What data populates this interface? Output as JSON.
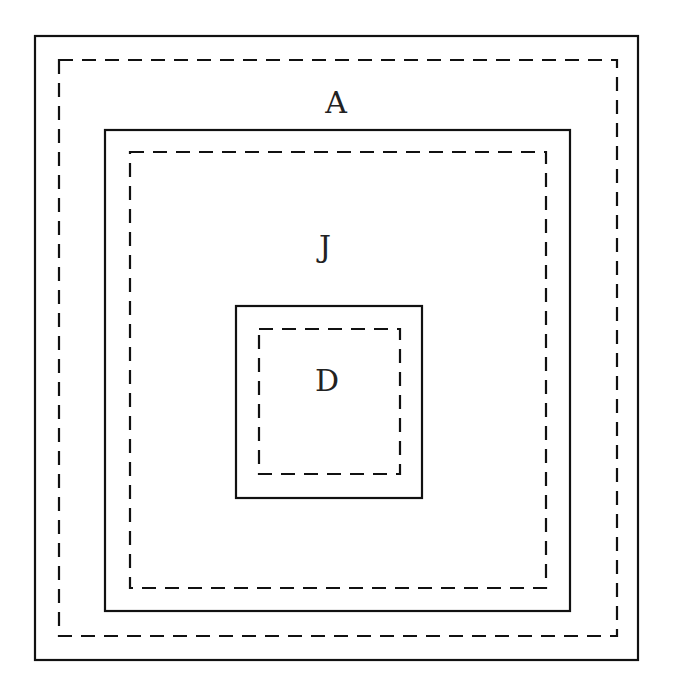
{
  "diagram": {
    "type": "nested-regions",
    "regions": [
      {
        "label": "A",
        "solid": {
          "x1": 35,
          "y1": 36,
          "x2": 638,
          "y2": 660
        },
        "dashed": {
          "x1": 59,
          "y1": 60,
          "x2": 617,
          "y2": 636
        },
        "label_pos": {
          "x": 336,
          "y": 113
        }
      },
      {
        "label": "J",
        "solid": {
          "x1": 105,
          "y1": 130,
          "x2": 570,
          "y2": 611
        },
        "dashed": {
          "x1": 130,
          "y1": 152,
          "x2": 546,
          "y2": 588
        },
        "label_pos": {
          "x": 325,
          "y": 257
        }
      },
      {
        "label": "D",
        "solid": {
          "x1": 236,
          "y1": 306,
          "x2": 422,
          "y2": 498
        },
        "dashed": {
          "x1": 259,
          "y1": 329,
          "x2": 400,
          "y2": 474
        },
        "label_pos": {
          "x": 327,
          "y": 391
        }
      }
    ],
    "colors": {
      "line": "#111111",
      "text": "#222222",
      "background": "#ffffff"
    }
  }
}
